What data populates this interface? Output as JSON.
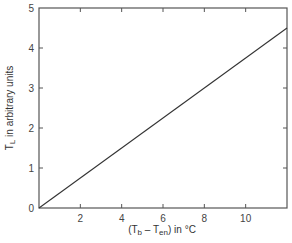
{
  "chart_data": {
    "type": "line",
    "title": "",
    "xlabel": "(T_b - T_en) in °C",
    "ylabel": "T_L in arbitrary units",
    "xlabel_parts": {
      "open": "(T",
      "sub1": "b",
      "mid": " – T",
      "sub2": "en",
      "close": ") in °C"
    },
    "ylabel_parts": {
      "main": "T",
      "sub": "L",
      "rest": " in arbitrary units"
    },
    "xlim": [
      0,
      12
    ],
    "ylim": [
      0,
      5
    ],
    "x_ticks": [
      2,
      4,
      6,
      8,
      10
    ],
    "y_ticks": [
      0,
      1,
      2,
      3,
      4,
      5
    ],
    "grid": false,
    "legend": null,
    "series": [
      {
        "name": "T_L",
        "x": [
          0,
          12
        ],
        "y": [
          0,
          4.5
        ],
        "color": "#333333"
      }
    ]
  }
}
